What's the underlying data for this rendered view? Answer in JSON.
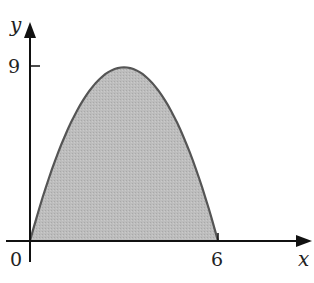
{
  "chart_data": {
    "type": "area",
    "function": "y = x(6 - x)",
    "x": [
      0,
      0.5,
      1,
      1.5,
      2,
      2.5,
      3,
      3.5,
      4,
      4.5,
      5,
      5.5,
      6
    ],
    "values": [
      0,
      2.75,
      5,
      6.75,
      8,
      8.75,
      9,
      8.75,
      8,
      6.75,
      5,
      2.75,
      0
    ],
    "title": "",
    "xlabel": "x",
    "ylabel": "y",
    "x_ticks": [
      "0",
      "6"
    ],
    "y_ticks": [
      "9"
    ],
    "xlim": [
      0,
      8.4
    ],
    "ylim": [
      0,
      11
    ],
    "grid": false,
    "fill_color": "#b8b8b8",
    "line_color": "#555555"
  },
  "labels": {
    "origin": "0",
    "x_tick_6": "6",
    "y_tick_9": "9",
    "x_axis": "x",
    "y_axis": "y"
  }
}
